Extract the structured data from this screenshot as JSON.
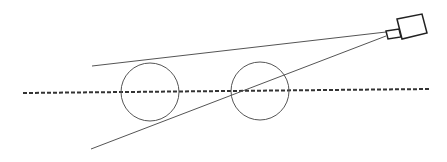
{
  "diagram": {
    "colors": {
      "background": "#ffffff",
      "stroke": "#555555",
      "camera_stroke": "#222222",
      "axis": "#333333"
    },
    "axis": {
      "x1": 23,
      "y1": 93,
      "x2": 430,
      "y2": 89,
      "dash": "4 2",
      "width": 2
    },
    "view_lines": [
      {
        "name": "upper-view-line",
        "x1": 92,
        "y1": 66,
        "x2": 386,
        "y2": 32
      },
      {
        "name": "lower-view-line",
        "x1": 91,
        "y1": 149,
        "x2": 386,
        "y2": 36
      }
    ],
    "circles": [
      {
        "name": "circle-left",
        "cx": 150,
        "cy": 92,
        "r": 29
      },
      {
        "name": "circle-right",
        "cx": 260,
        "cy": 91,
        "r": 29
      }
    ],
    "camera": {
      "lens": {
        "points": "386,31 399,29 401,37 388,39"
      },
      "body": {
        "points": "397,19 422,14 427,33 402,39"
      }
    }
  }
}
